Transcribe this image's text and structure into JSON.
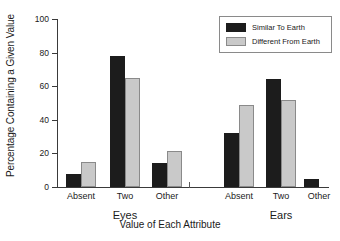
{
  "chart_data": {
    "type": "bar",
    "title": "",
    "xlabel": "Value of Each Attribute",
    "ylabel": "Percentage Containing a Given Value",
    "ylim": [
      0,
      100
    ],
    "yticks": [
      0,
      20,
      40,
      60,
      80,
      100
    ],
    "ytick_labels": [
      "0",
      "20",
      "40",
      "60",
      "80",
      "100"
    ],
    "grid": false,
    "legend_position": "top-right",
    "groups": [
      {
        "name": "Eyes",
        "categories": [
          "Absent",
          "Two",
          "Other"
        ]
      },
      {
        "name": "Ears",
        "categories": [
          "Absent",
          "Two",
          "Other"
        ]
      }
    ],
    "categories": [
      "Absent",
      "Two",
      "Other",
      "Absent",
      "Two",
      "Other"
    ],
    "series": [
      {
        "name": "Similar To Earth",
        "color": "#1c1c1c",
        "values": [
          8,
          78,
          14.5,
          32,
          64,
          4.5
        ]
      },
      {
        "name": "Different From Earth",
        "color": "#c9c9c9",
        "values": [
          15,
          65,
          21.5,
          49,
          51.5,
          0
        ]
      }
    ]
  },
  "legend": {
    "entries": [
      {
        "label": "Similar To Earth",
        "color": "#1c1c1c"
      },
      {
        "label": "Different From Earth",
        "color": "#c9c9c9"
      }
    ]
  }
}
